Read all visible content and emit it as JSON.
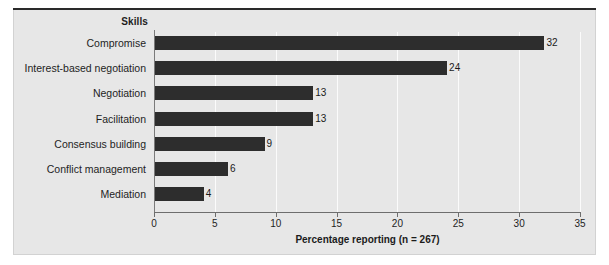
{
  "figure": {
    "background_color": "#e7e7e7",
    "page_color": "#ffffff",
    "top_rule_color": "#2a2a2a",
    "bar_color": "#2d2d2d",
    "gridline_color": "#fbfbfb",
    "axis_color": "#6e6e6e"
  },
  "category_header": "Skills",
  "chart_data": {
    "type": "bar",
    "orientation": "horizontal",
    "title": "",
    "subtitle": "",
    "xlabel": "Percentage reporting (n = 267)",
    "ylabel": "Skills",
    "categories": [
      "Compromise",
      "Interest-based negotiation",
      "Negotiation",
      "Facilitation",
      "Consensus building",
      "Conflict management",
      "Mediation"
    ],
    "values": [
      32,
      24,
      13,
      13,
      9,
      6,
      4
    ],
    "value_labels": [
      "32",
      "24",
      "13",
      "13",
      "9",
      "6",
      "4"
    ],
    "xlim": [
      0,
      35
    ],
    "ylim": null,
    "xticks": [
      0,
      5,
      10,
      15,
      20,
      25,
      30,
      35
    ],
    "xtick_labels": [
      "0",
      "5",
      "10",
      "15",
      "20",
      "25",
      "30",
      "35"
    ],
    "grid": "vertical",
    "legend": "none",
    "data_labels": true,
    "n": 267
  }
}
